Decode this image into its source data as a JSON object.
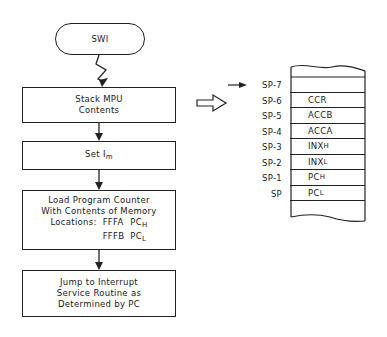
{
  "flowchart": {
    "start": {
      "label": "SWI"
    },
    "steps": [
      {
        "lines": [
          "Stack MPU",
          "Contents"
        ]
      },
      {
        "text": "Set I",
        "subscript": "m"
      },
      {
        "lines": [
          "Load Program Counter",
          "With Contents of Memory"
        ],
        "locations_label": "Locations:",
        "locations": [
          {
            "address": "FFFA",
            "register": "PC",
            "subscript": "H"
          },
          {
            "address": "FFFB",
            "register": "PC",
            "subscript": "L"
          }
        ]
      },
      {
        "lines": [
          "Jump to Interrupt",
          "Service Routine as",
          "Determined by PC"
        ]
      }
    ]
  },
  "stack": {
    "rows": [
      {
        "address": "SP-7",
        "content": "",
        "subscript": ""
      },
      {
        "address": "SP-6",
        "content": "CCR",
        "subscript": ""
      },
      {
        "address": "SP-5",
        "content": "ACCB",
        "subscript": ""
      },
      {
        "address": "SP-4",
        "content": "ACCA",
        "subscript": ""
      },
      {
        "address": "SP-3",
        "content": "INX",
        "subscript": "H"
      },
      {
        "address": "SP-2",
        "content": "INX",
        "subscript": "L"
      },
      {
        "address": "SP-1",
        "content": "PC",
        "subscript": "H"
      },
      {
        "address": "SP",
        "content": "PC",
        "subscript": "L"
      },
      {
        "address": "",
        "content": "",
        "subscript": ""
      }
    ],
    "pointer_target": "SP-7"
  }
}
